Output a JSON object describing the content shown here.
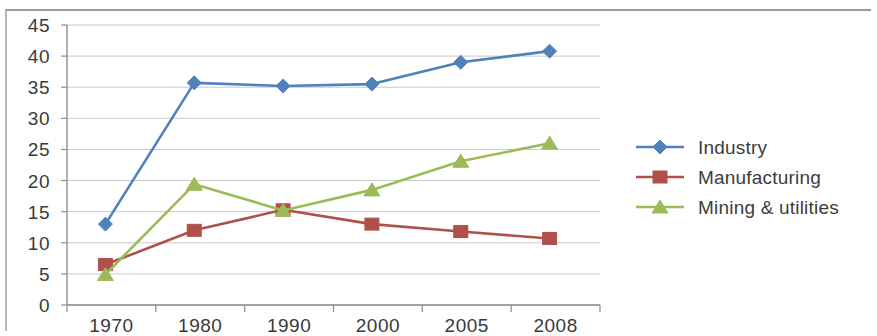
{
  "chart_data": {
    "type": "line",
    "title": "",
    "subtitle": "",
    "xlabel": "",
    "ylabel": "",
    "categories": [
      "1970",
      "1980",
      "1990",
      "2000",
      "2005",
      "2008"
    ],
    "ylim": [
      0,
      45
    ],
    "ytick_step": 5,
    "yticks": [
      "0",
      "5",
      "10",
      "15",
      "20",
      "25",
      "30",
      "35",
      "40",
      "45"
    ],
    "grid": true,
    "legend_position": "right",
    "series": [
      {
        "name": "Industry",
        "color": "#4F81BD",
        "marker": "diamond",
        "values": [
          13.0,
          35.7,
          35.2,
          35.5,
          39.0,
          40.8
        ]
      },
      {
        "name": "Manufacturing",
        "color": "#B0504B",
        "marker": "square",
        "values": [
          6.5,
          12.0,
          15.3,
          13.0,
          11.8,
          10.7
        ]
      },
      {
        "name": "Mining & utilities",
        "color": "#9BBB59",
        "marker": "triangle",
        "values": [
          4.9,
          19.4,
          15.2,
          18.5,
          23.1,
          26.0
        ]
      }
    ]
  },
  "legend": {
    "items": [
      {
        "label": "Industry"
      },
      {
        "label": "Manufacturing"
      },
      {
        "label": "Mining & utilities"
      }
    ]
  }
}
